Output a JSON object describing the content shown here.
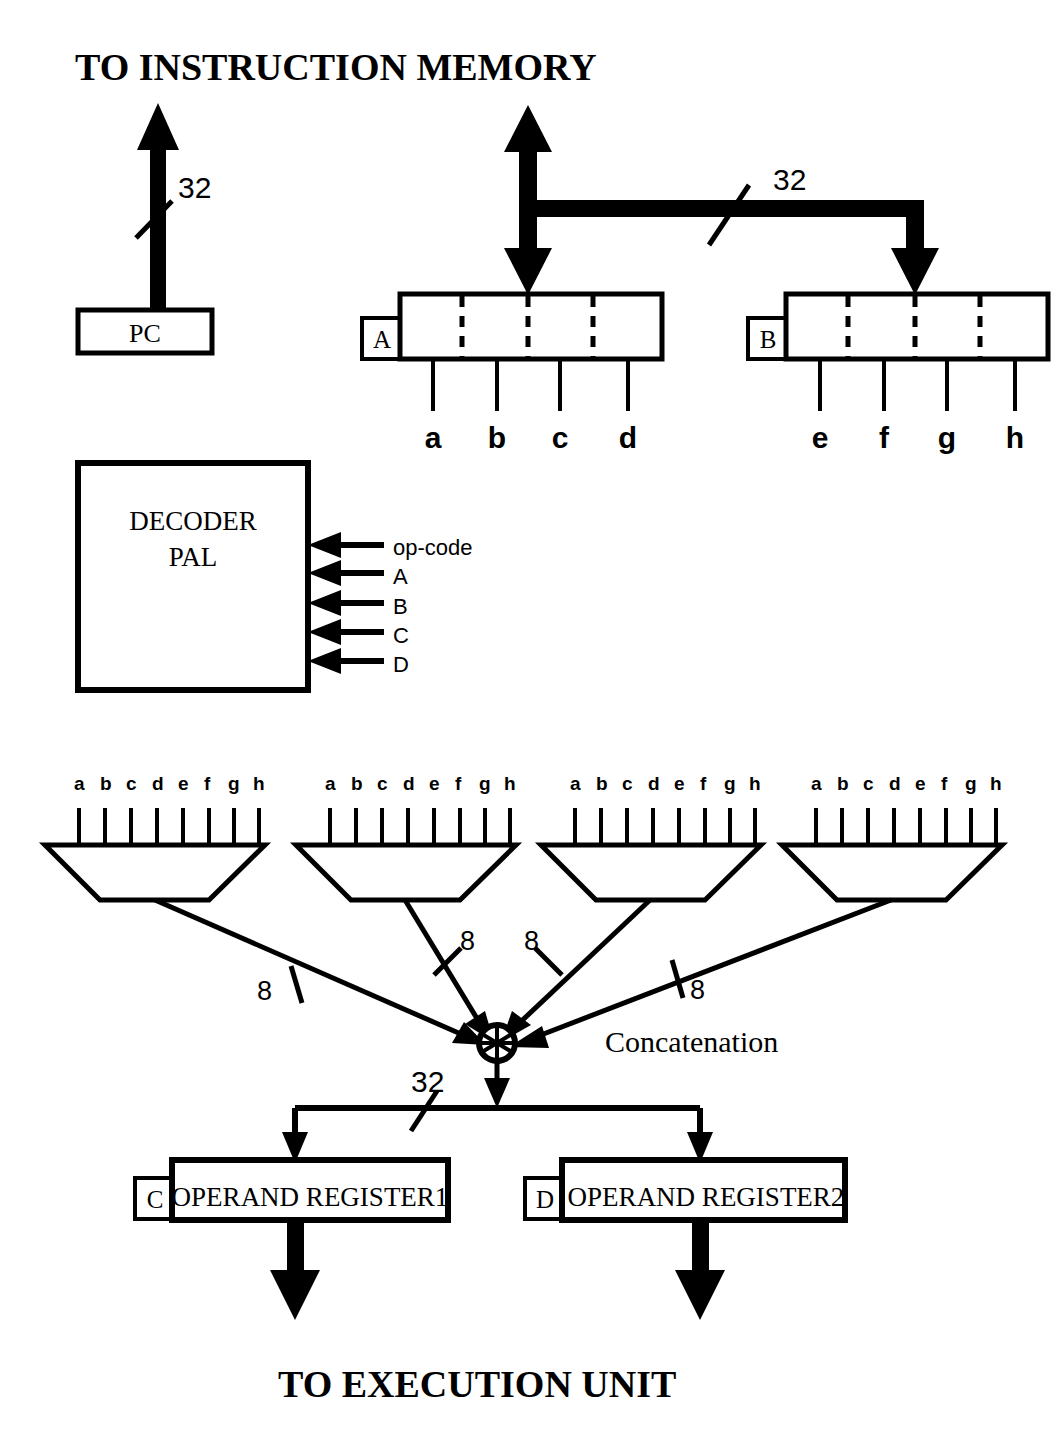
{
  "figure": {
    "title_top": "TO INSTRUCTION MEMORY",
    "title_bottom": "TO EXECUTION UNIT",
    "background_color": "#ffffff",
    "ink_color": "#000000"
  },
  "program_counter": {
    "label": "PC",
    "bus_width_label": "32"
  },
  "instruction_bus": {
    "width_label": "32"
  },
  "register_a": {
    "tag": "A",
    "field_labels": [
      "a",
      "b",
      "c",
      "d"
    ]
  },
  "register_b": {
    "tag": "B",
    "field_labels": [
      "e",
      "f",
      "g",
      "h"
    ]
  },
  "decoder": {
    "line1": "DECODER",
    "line2": "PAL",
    "inputs": [
      {
        "label": "op-code"
      },
      {
        "label": "A"
      },
      {
        "label": "B"
      },
      {
        "label": "C"
      },
      {
        "label": "D"
      }
    ]
  },
  "multiplexers": [
    {
      "inputs": [
        "a",
        "b",
        "c",
        "d",
        "e",
        "f",
        "g",
        "h"
      ],
      "output_width_label": "8"
    },
    {
      "inputs": [
        "a",
        "b",
        "c",
        "d",
        "e",
        "f",
        "g",
        "h"
      ],
      "output_width_label": "8"
    },
    {
      "inputs": [
        "a",
        "b",
        "c",
        "d",
        "e",
        "f",
        "g",
        "h"
      ],
      "output_width_label": "8"
    },
    {
      "inputs": [
        "a",
        "b",
        "c",
        "d",
        "e",
        "f",
        "g",
        "h"
      ],
      "output_width_label": "8"
    }
  ],
  "concatenation": {
    "label": "Concatenation",
    "output_width_label": "32"
  },
  "operand_registers": [
    {
      "tag": "C",
      "name": "OPERAND REGISTER1"
    },
    {
      "tag": "D",
      "name": "OPERAND REGISTER2"
    }
  ]
}
